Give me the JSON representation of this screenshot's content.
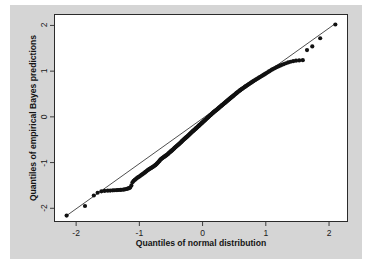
{
  "figure": {
    "background_color": "#ffffff",
    "panel_color": "#d5d5d5",
    "plot_background": "#ffffff",
    "frame_color": "#2b2b2b"
  },
  "chart_data": {
    "type": "scatter",
    "title": "",
    "subtitle": "",
    "xlabel": "Quantiles of normal distribution",
    "ylabel": "Quantiles of empirical Bayes predictions",
    "xlim": [
      -2.35,
      2.3
    ],
    "ylim": [
      -2.3,
      2.25
    ],
    "xticks": [
      -2,
      -1,
      0,
      1,
      2
    ],
    "yticks": [
      -2,
      -1,
      0,
      1,
      2
    ],
    "xticklabels": [
      "-2",
      "-1",
      "0",
      "1",
      "2"
    ],
    "yticklabels": [
      "-2",
      "-1",
      "0",
      "1",
      "2"
    ],
    "grid": false,
    "legend": null,
    "marker": {
      "shape": "circle",
      "color": "#111111",
      "size_px": 3.4,
      "filled": true
    },
    "reference_line": {
      "label": "identity/QQ reference line",
      "color": "#222222",
      "width_px": 0.8,
      "x": [
        -2.15,
        2.1
      ],
      "y": [
        -2.16,
        2.04
      ]
    },
    "n_points": 301,
    "series": [
      {
        "name": "empirical Bayes predictions",
        "x": [
          -2.15,
          -1.86,
          -1.72,
          -1.66,
          -1.6,
          -1.55,
          -1.5,
          -1.46,
          -1.42,
          -1.39,
          -1.355,
          -1.33,
          -1.3,
          -1.275,
          -1.25,
          -1.228,
          -1.205,
          -1.185,
          -1.165,
          -1.145,
          -1.126,
          -1.108,
          -1.09,
          -1.073,
          -1.056,
          -1.039,
          -1.023,
          -1.007,
          -0.991,
          -0.976,
          -0.961,
          -0.946,
          -0.932,
          -0.917,
          -0.903,
          -0.889,
          -0.876,
          -0.862,
          -0.849,
          -0.836,
          -0.823,
          -0.81,
          -0.798,
          -0.785,
          -0.773,
          -0.761,
          -0.749,
          -0.737,
          -0.725,
          -0.714,
          -0.702,
          -0.691,
          -0.68,
          -0.669,
          -0.658,
          -0.647,
          -0.636,
          -0.625,
          -0.615,
          -0.604,
          -0.594,
          -0.583,
          -0.573,
          -0.563,
          -0.553,
          -0.543,
          -0.533,
          -0.523,
          -0.513,
          -0.503,
          -0.494,
          -0.484,
          -0.474,
          -0.465,
          -0.455,
          -0.446,
          -0.437,
          -0.427,
          -0.418,
          -0.409,
          -0.4,
          -0.391,
          -0.382,
          -0.373,
          -0.364,
          -0.355,
          -0.346,
          -0.337,
          -0.329,
          -0.32,
          -0.311,
          -0.303,
          -0.294,
          -0.286,
          -0.277,
          -0.269,
          -0.26,
          -0.252,
          -0.243,
          -0.235,
          -0.227,
          -0.218,
          -0.21,
          -0.202,
          -0.194,
          -0.186,
          -0.177,
          -0.169,
          -0.161,
          -0.153,
          -0.145,
          -0.137,
          -0.129,
          -0.121,
          -0.113,
          -0.105,
          -0.097,
          -0.089,
          -0.081,
          -0.073,
          -0.065,
          -0.058,
          -0.05,
          -0.042,
          -0.034,
          -0.026,
          -0.018,
          -0.01,
          -0.003,
          0.005,
          0.013,
          0.021,
          0.029,
          0.036,
          0.044,
          0.052,
          0.06,
          0.068,
          0.076,
          0.083,
          0.091,
          0.099,
          0.107,
          0.115,
          0.123,
          0.131,
          0.139,
          0.147,
          0.155,
          0.163,
          0.171,
          0.179,
          0.187,
          0.195,
          0.203,
          0.211,
          0.219,
          0.228,
          0.236,
          0.244,
          0.253,
          0.261,
          0.269,
          0.278,
          0.286,
          0.295,
          0.303,
          0.312,
          0.321,
          0.33,
          0.338,
          0.347,
          0.356,
          0.365,
          0.374,
          0.383,
          0.393,
          0.402,
          0.411,
          0.421,
          0.43,
          0.44,
          0.449,
          0.459,
          0.469,
          0.479,
          0.489,
          0.499,
          0.509,
          0.52,
          0.53,
          0.541,
          0.551,
          0.562,
          0.573,
          0.584,
          0.596,
          0.607,
          0.619,
          0.63,
          0.642,
          0.654,
          0.667,
          0.679,
          0.692,
          0.705,
          0.718,
          0.731,
          0.745,
          0.759,
          0.773,
          0.787,
          0.802,
          0.817,
          0.832,
          0.848,
          0.864,
          0.881,
          0.898,
          0.915,
          0.933,
          0.951,
          0.97,
          0.989,
          1.009,
          1.03,
          1.051,
          1.073,
          1.096,
          1.12,
          1.145,
          1.17,
          1.197,
          1.225,
          1.255,
          1.286,
          1.319,
          1.354,
          1.392,
          1.433,
          1.478,
          1.528,
          1.585,
          1.652,
          1.735,
          1.86,
          2.1
        ],
        "y": [
          -2.16,
          -1.95,
          -1.72,
          -1.66,
          -1.63,
          -1.62,
          -1.615,
          -1.612,
          -1.608,
          -1.605,
          -1.602,
          -1.6,
          -1.598,
          -1.595,
          -1.59,
          -1.585,
          -1.578,
          -1.57,
          -1.56,
          -1.548,
          -1.5,
          -1.43,
          -1.4,
          -1.38,
          -1.36,
          -1.34,
          -1.325,
          -1.31,
          -1.295,
          -1.28,
          -1.265,
          -1.25,
          -1.235,
          -1.22,
          -1.205,
          -1.19,
          -1.175,
          -1.16,
          -1.148,
          -1.137,
          -1.126,
          -1.115,
          -1.104,
          -1.093,
          -1.082,
          -1.07,
          -1.057,
          -1.043,
          -1.028,
          -1.012,
          -0.995,
          -0.977,
          -0.958,
          -0.94,
          -0.925,
          -0.912,
          -0.9,
          -0.89,
          -0.88,
          -0.87,
          -0.86,
          -0.85,
          -0.84,
          -0.829,
          -0.818,
          -0.806,
          -0.793,
          -0.78,
          -0.768,
          -0.756,
          -0.745,
          -0.734,
          -0.722,
          -0.71,
          -0.698,
          -0.686,
          -0.673,
          -0.66,
          -0.648,
          -0.637,
          -0.627,
          -0.617,
          -0.607,
          -0.596,
          -0.585,
          -0.573,
          -0.561,
          -0.549,
          -0.537,
          -0.525,
          -0.513,
          -0.502,
          -0.491,
          -0.481,
          -0.471,
          -0.461,
          -0.451,
          -0.441,
          -0.431,
          -0.42,
          -0.409,
          -0.398,
          -0.387,
          -0.376,
          -0.365,
          -0.354,
          -0.343,
          -0.333,
          -0.323,
          -0.313,
          -0.303,
          -0.293,
          -0.283,
          -0.273,
          -0.263,
          -0.253,
          -0.243,
          -0.233,
          -0.223,
          -0.213,
          -0.203,
          -0.193,
          -0.183,
          -0.173,
          -0.163,
          -0.153,
          -0.143,
          -0.133,
          -0.123,
          -0.113,
          -0.103,
          -0.093,
          -0.083,
          -0.073,
          -0.063,
          -0.053,
          -0.043,
          -0.033,
          -0.023,
          -0.013,
          -0.003,
          0.007,
          0.017,
          0.027,
          0.037,
          0.047,
          0.057,
          0.067,
          0.077,
          0.087,
          0.097,
          0.107,
          0.116,
          0.125,
          0.134,
          0.143,
          0.152,
          0.161,
          0.17,
          0.18,
          0.19,
          0.2,
          0.21,
          0.22,
          0.23,
          0.24,
          0.25,
          0.26,
          0.27,
          0.28,
          0.29,
          0.3,
          0.31,
          0.321,
          0.332,
          0.343,
          0.354,
          0.365,
          0.376,
          0.387,
          0.398,
          0.409,
          0.42,
          0.431,
          0.442,
          0.453,
          0.464,
          0.476,
          0.488,
          0.5,
          0.512,
          0.524,
          0.536,
          0.548,
          0.56,
          0.572,
          0.584,
          0.596,
          0.607,
          0.618,
          0.63,
          0.642,
          0.654,
          0.666,
          0.678,
          0.69,
          0.702,
          0.715,
          0.728,
          0.741,
          0.754,
          0.767,
          0.78,
          0.793,
          0.806,
          0.82,
          0.834,
          0.848,
          0.862,
          0.877,
          0.892,
          0.907,
          0.923,
          0.94,
          0.957,
          0.975,
          0.994,
          1.013,
          1.032,
          1.05,
          1.068,
          1.086,
          1.103,
          1.12,
          1.138,
          1.155,
          1.173,
          1.19,
          1.205,
          1.218,
          1.228,
          1.235,
          1.24,
          1.46,
          1.54,
          1.72,
          2.02
        ]
      }
    ]
  },
  "axes": {
    "x_title": "Quantiles of normal distribution",
    "y_title": "Quantiles of empirical Bayes predictions",
    "x_tick_labels": [
      "-2",
      "-1",
      "0",
      "1",
      "2"
    ],
    "y_tick_labels": [
      "-2",
      "-1",
      "0",
      "1",
      "2"
    ]
  }
}
